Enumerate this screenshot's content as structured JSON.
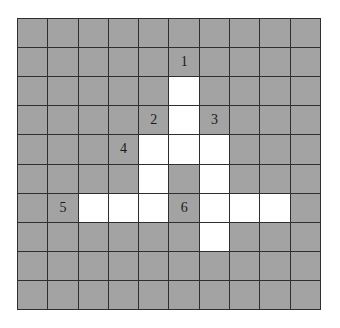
{
  "puzzle": {
    "rows": 10,
    "cols": 10,
    "colors": {
      "gray": "#a3a3a3",
      "white": "#ffffff",
      "grid_line": "#2f2f2f"
    },
    "white_cells": [
      [
        2,
        5
      ],
      [
        3,
        5
      ],
      [
        4,
        4
      ],
      [
        4,
        5
      ],
      [
        4,
        6
      ],
      [
        5,
        4
      ],
      [
        5,
        6
      ],
      [
        6,
        2
      ],
      [
        6,
        3
      ],
      [
        6,
        4
      ],
      [
        6,
        6
      ],
      [
        6,
        7
      ],
      [
        6,
        8
      ],
      [
        7,
        6
      ]
    ],
    "labels": [
      {
        "text": "1",
        "row": 1,
        "col": 5
      },
      {
        "text": "2",
        "row": 3,
        "col": 4
      },
      {
        "text": "3",
        "row": 3,
        "col": 6
      },
      {
        "text": "4",
        "row": 4,
        "col": 3
      },
      {
        "text": "5",
        "row": 6,
        "col": 1
      },
      {
        "text": "6",
        "row": 6,
        "col": 5
      }
    ]
  }
}
